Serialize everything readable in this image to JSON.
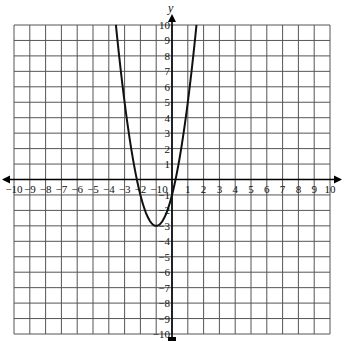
{
  "chart_data": {
    "type": "line",
    "title": "",
    "xlabel": "",
    "ylabel": "y",
    "xlim": [
      -10,
      10
    ],
    "ylim": [
      -10,
      10
    ],
    "grid": true,
    "x_ticks": [
      -10,
      -9,
      -8,
      -7,
      -6,
      -5,
      -4,
      -3,
      -2,
      -1,
      0,
      1,
      2,
      3,
      4,
      5,
      6,
      7,
      8,
      9,
      10
    ],
    "y_ticks": [
      -10,
      -9,
      -8,
      -7,
      -6,
      -5,
      -4,
      -3,
      -2,
      -1,
      1,
      2,
      3,
      4,
      5,
      6,
      7,
      8,
      9,
      10
    ],
    "series": [
      {
        "name": "parabola",
        "equation": "y = 2(x+1)^2 - 3",
        "vertex": [
          -1,
          -3
        ],
        "x_intercepts": [
          -2.22,
          0.22
        ],
        "y_intercept": -1,
        "coefficients": {
          "a": 2,
          "h": -1,
          "k": -3
        },
        "x_range": [
          -3.55,
          1.55
        ],
        "color": "#111111"
      }
    ]
  },
  "labels": {
    "y_axis": "y",
    "origin": "0"
  },
  "colors": {
    "grid": "#555555",
    "axis": "#000000",
    "curve": "#111111"
  }
}
